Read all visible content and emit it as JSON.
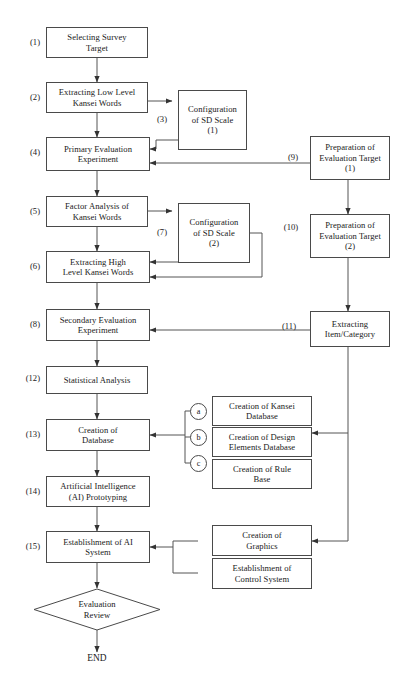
{
  "diagram": {
    "end_label": "END",
    "nodes": [
      {
        "id": "n1",
        "step": "(1)",
        "lines": [
          "Selecting Survey",
          "Target"
        ]
      },
      {
        "id": "n2",
        "step": "(2)",
        "lines": [
          "Extracting Low Level",
          "Kansei Words"
        ]
      },
      {
        "id": "n3",
        "step": "(3)",
        "lines": [
          "Configuration",
          "of SD Scale",
          "(1)"
        ]
      },
      {
        "id": "n4",
        "step": "(4)",
        "lines": [
          "Primary Evaluation",
          "Experiment"
        ]
      },
      {
        "id": "n5",
        "step": "(5)",
        "lines": [
          "Factor Analysis of",
          "Kansei Words"
        ]
      },
      {
        "id": "n6",
        "step": "(6)",
        "lines": [
          "Extracting High",
          "Level Kansei Words"
        ]
      },
      {
        "id": "n7",
        "step": "(7)",
        "lines": [
          "Configuration",
          "of SD Scale",
          "(2)"
        ]
      },
      {
        "id": "n8",
        "step": "(8)",
        "lines": [
          "Secondary Evaluation",
          "Experiment"
        ]
      },
      {
        "id": "n9",
        "step": "(9)",
        "lines": [
          "Preparation of",
          "Evaluation Target",
          "(1)"
        ]
      },
      {
        "id": "n10",
        "step": "(10)",
        "lines": [
          "Preparation of",
          "Evaluation Target",
          "(2)"
        ]
      },
      {
        "id": "n11",
        "step": "(11)",
        "lines": [
          "Extracting",
          "Item/Category"
        ]
      },
      {
        "id": "n12",
        "step": "(12)",
        "lines": [
          "Statistical Analysis"
        ]
      },
      {
        "id": "n13",
        "step": "(13)",
        "lines": [
          "Creation of",
          "Database"
        ]
      },
      {
        "id": "n14",
        "step": "(14)",
        "lines": [
          "Artificial Intelligence",
          "(AI) Prototyping"
        ]
      },
      {
        "id": "n15",
        "step": "(15)",
        "lines": [
          "Establishment of AI",
          "System"
        ]
      },
      {
        "id": "na",
        "step": "a",
        "lines": [
          "Creation of Kansei",
          "Database"
        ]
      },
      {
        "id": "nb",
        "step": "b",
        "lines": [
          "Creation of Design",
          "Elements Database"
        ]
      },
      {
        "id": "nc",
        "step": "c",
        "lines": [
          "Creation of Rule",
          "Base"
        ]
      },
      {
        "id": "ng",
        "step": "",
        "lines": [
          "Creation of",
          "Graphics"
        ]
      },
      {
        "id": "ncs",
        "step": "",
        "lines": [
          "Establishment of",
          "Control System"
        ]
      }
    ],
    "decision": {
      "id": "d1",
      "lines": [
        "Evaluation",
        "Review"
      ]
    },
    "colors": {
      "stroke": "#4a4a4a",
      "text": "#1a1a1a",
      "background": "#ffffff"
    }
  }
}
